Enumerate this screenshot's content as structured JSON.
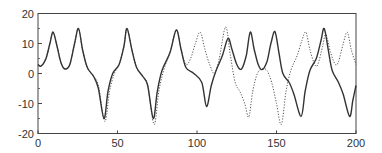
{
  "chart_data": {
    "type": "line",
    "title": "",
    "xlabel": "",
    "ylabel": "",
    "xlim": [
      0,
      200
    ],
    "ylim": [
      -20,
      20
    ],
    "xticks": [
      0,
      50,
      100,
      150,
      200
    ],
    "yticks": [
      -20,
      -10,
      0,
      10,
      20
    ],
    "xtick_labels": [
      "0",
      "50",
      "100",
      "150",
      "200"
    ],
    "ytick_labels": [
      "-20",
      "-10",
      "0",
      "10",
      "20"
    ],
    "grid": false,
    "legend": null,
    "series": [
      {
        "name": "solid",
        "style": "solid",
        "color": "#333333",
        "points": [
          [
            0,
            3
          ],
          [
            2,
            2.5
          ],
          [
            5,
            5
          ],
          [
            7.5,
            10
          ],
          [
            9.5,
            13.8
          ],
          [
            12,
            9
          ],
          [
            14.5,
            3.5
          ],
          [
            17,
            1.5
          ],
          [
            20,
            3
          ],
          [
            23,
            10
          ],
          [
            25.5,
            15
          ],
          [
            28,
            8
          ],
          [
            31,
            2
          ],
          [
            35,
            -1
          ],
          [
            38,
            -5
          ],
          [
            41.5,
            -15
          ],
          [
            44,
            -6
          ],
          [
            47,
            0
          ],
          [
            51,
            3
          ],
          [
            54,
            9
          ],
          [
            56,
            15
          ],
          [
            59,
            8
          ],
          [
            62,
            2
          ],
          [
            66,
            -1
          ],
          [
            69,
            -4
          ],
          [
            72.5,
            -15
          ],
          [
            75,
            -6
          ],
          [
            78,
            1
          ],
          [
            83,
            7
          ],
          [
            87,
            14.5
          ],
          [
            90,
            8
          ],
          [
            93,
            2
          ],
          [
            98,
            0
          ],
          [
            103,
            -3
          ],
          [
            106,
            -11
          ],
          [
            109,
            -4
          ],
          [
            112,
            1
          ],
          [
            116,
            6
          ],
          [
            119.5,
            11.7
          ],
          [
            122,
            8
          ],
          [
            125,
            3
          ],
          [
            128,
            1.5
          ],
          [
            131,
            6
          ],
          [
            133.5,
            13.8
          ],
          [
            136,
            8
          ],
          [
            138.5,
            3
          ],
          [
            141,
            1.3
          ],
          [
            144,
            4
          ],
          [
            146.5,
            10
          ],
          [
            149,
            14
          ],
          [
            151.5,
            7
          ],
          [
            154,
            0
          ],
          [
            158,
            -3
          ],
          [
            161,
            -7
          ],
          [
            165.5,
            -14.3
          ],
          [
            168,
            -6
          ],
          [
            171,
            1
          ],
          [
            175,
            5
          ],
          [
            178,
            11
          ],
          [
            180,
            15
          ],
          [
            182.5,
            8
          ],
          [
            185,
            1
          ],
          [
            189,
            -3
          ],
          [
            192,
            -7
          ],
          [
            196,
            -14.3
          ],
          [
            198,
            -9
          ],
          [
            200,
            -4
          ]
        ]
      },
      {
        "name": "dotted",
        "style": "dotted",
        "color": "#555555",
        "points": [
          [
            0,
            3
          ],
          [
            2,
            2.5
          ],
          [
            5,
            5
          ],
          [
            7.5,
            10
          ],
          [
            9.5,
            13.8
          ],
          [
            12,
            9
          ],
          [
            14.5,
            3.5
          ],
          [
            17,
            1.5
          ],
          [
            20,
            3
          ],
          [
            23,
            10
          ],
          [
            25.5,
            15
          ],
          [
            28,
            8
          ],
          [
            31,
            2
          ],
          [
            35,
            -1
          ],
          [
            38,
            -4
          ],
          [
            42,
            -16
          ],
          [
            45,
            -6
          ],
          [
            48,
            0
          ],
          [
            51,
            3
          ],
          [
            54,
            9
          ],
          [
            56,
            15
          ],
          [
            59,
            8
          ],
          [
            62,
            2
          ],
          [
            66,
            -1
          ],
          [
            69,
            -4
          ],
          [
            73,
            -17
          ],
          [
            76,
            -6
          ],
          [
            79,
            1
          ],
          [
            83,
            7
          ],
          [
            87,
            14.5
          ],
          [
            90,
            8
          ],
          [
            93,
            3
          ],
          [
            96,
            5
          ],
          [
            99,
            10
          ],
          [
            102,
            13.8
          ],
          [
            105,
            8
          ],
          [
            108,
            3
          ],
          [
            111,
            0
          ],
          [
            114,
            5
          ],
          [
            118,
            15.5
          ],
          [
            121,
            6
          ],
          [
            124,
            -3
          ],
          [
            127,
            -6
          ],
          [
            130,
            -10
          ],
          [
            132.6,
            -14.5
          ],
          [
            135,
            -6
          ],
          [
            138,
            0
          ],
          [
            141,
            1.5
          ],
          [
            144,
            1
          ],
          [
            147,
            -3
          ],
          [
            150,
            -10
          ],
          [
            153,
            -17
          ],
          [
            156,
            -6
          ],
          [
            159,
            1
          ],
          [
            163,
            6
          ],
          [
            166,
            11
          ],
          [
            168.5,
            13.8
          ],
          [
            171,
            8
          ],
          [
            174,
            3
          ],
          [
            176,
            3
          ],
          [
            179,
            9
          ],
          [
            181,
            13
          ],
          [
            184,
            7
          ],
          [
            187,
            3
          ],
          [
            189,
            4
          ],
          [
            192,
            10
          ],
          [
            194.5,
            13.8
          ],
          [
            197,
            8
          ],
          [
            200,
            3
          ]
        ]
      }
    ]
  }
}
